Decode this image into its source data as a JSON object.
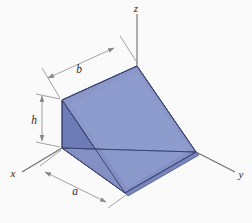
{
  "figure": {
    "background_color": "#fbfafa"
  },
  "axes": {
    "z": {
      "label": "z"
    },
    "y": {
      "label": "y"
    },
    "x": {
      "label": "x"
    },
    "line_color": "#6e6e6e"
  },
  "dimensions": [
    {
      "name": "b",
      "label": "b",
      "description": "top back edge length"
    },
    {
      "name": "h",
      "label": "h",
      "description": "vertical height of back face"
    },
    {
      "name": "a",
      "label": "a",
      "description": "base depth along x"
    }
  ],
  "solid": {
    "faces": {
      "top_slope_color": "#8e9ccd",
      "inner_back_color": "#8490c4",
      "left_triangle_color": "#6c7cb5",
      "front_slope_color": "#7d8cc3",
      "bottom_color": "#9aa5d2"
    },
    "edge_color": "#3f4a78"
  },
  "leader_lines": {
    "color": "#8a8a8a"
  }
}
